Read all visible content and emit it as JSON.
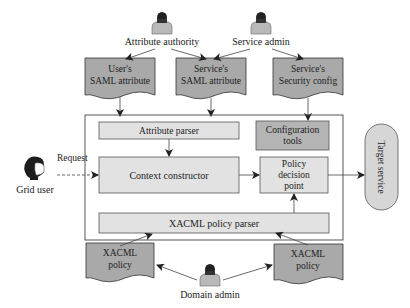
{
  "actors": {
    "attribute_authority": "Attribute authority",
    "service_admin": "Service admin",
    "grid_user": "Grid user",
    "domain_admin": "Domain admin"
  },
  "documents": {
    "users_saml": [
      "User's",
      "SAML attribute"
    ],
    "services_saml": [
      "Service's",
      "SAML attribute"
    ],
    "services_security": [
      "Service's",
      "Security config"
    ],
    "xacml_policy_left": [
      "XACML",
      "policy"
    ],
    "xacml_policy_right": [
      "XACML",
      "policy"
    ]
  },
  "components": {
    "attribute_parser": "Attribute parser",
    "configuration_tools": [
      "Configuration",
      "tools"
    ],
    "context_constructor": "Context constructor",
    "policy_decision_point": [
      "Policy",
      "decision",
      "point"
    ],
    "xacml_policy_parser": "XACML policy parser",
    "target_service": "Target service"
  },
  "edges": {
    "request_label": "Request"
  },
  "colors": {
    "document_fill": "#a9a9a9",
    "component_fill": "#e2e2e2",
    "config_fill": "#b4b4b4",
    "target_fill": "#d6d6d6",
    "stroke": "#333333",
    "person_body": "#b9b9b9",
    "person_head": "#222222"
  }
}
